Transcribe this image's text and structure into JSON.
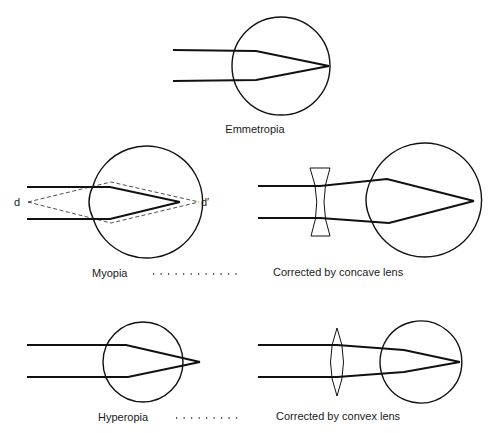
{
  "figure": {
    "panels": {
      "emmetropia": {
        "label": "Emmetropia"
      },
      "myopia": {
        "label": "Myopia",
        "near_point_label": "d",
        "far_point_label": "d′"
      },
      "myopia_corrected": {
        "label": "Corrected by concave lens"
      },
      "hyperopia": {
        "label": "Hyperopia"
      },
      "hyperopia_corrected": {
        "label": "Corrected by convex lens"
      }
    },
    "colors": {
      "background": "#ffffff",
      "line": "#111111"
    }
  }
}
